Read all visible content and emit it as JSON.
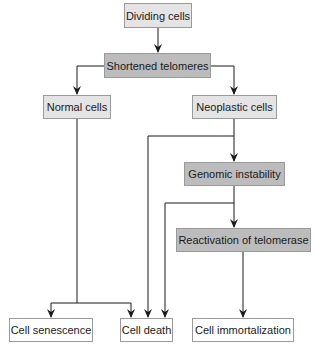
{
  "diagram": {
    "colors": {
      "light_box": "#e4e4e4",
      "dark_box": "#bcbcbc",
      "outcome_box": "#ffffff",
      "border": "#9a9a9a",
      "arrow": "#1a1a1a"
    },
    "nodes": {
      "dividing_cells": "Dividing cells",
      "shortened_telomeres": "Shortened telomeres",
      "normal_cells": "Normal cells",
      "neoplastic_cells": "Neoplastic cells",
      "genomic_instability": "Genomic instability",
      "reactivation_of_telomerase": "Reactivation of telomerase",
      "cell_senescence": "Cell senescence",
      "cell_death": "Cell death",
      "cell_immortalization": "Cell immortalization"
    },
    "edges": [
      {
        "from": "Dividing cells",
        "to": "Shortened telomeres"
      },
      {
        "from": "Shortened telomeres",
        "to": "Normal cells"
      },
      {
        "from": "Shortened telomeres",
        "to": "Neoplastic cells"
      },
      {
        "from": "Normal cells",
        "to": "Cell senescence"
      },
      {
        "from": "Normal cells",
        "to": "Cell death"
      },
      {
        "from": "Neoplastic cells",
        "to": "Genomic instability"
      },
      {
        "from": "Neoplastic cells",
        "to": "Cell death"
      },
      {
        "from": "Genomic instability",
        "to": "Reactivation of telomerase"
      },
      {
        "from": "Genomic instability",
        "to": "Cell death"
      },
      {
        "from": "Reactivation of telomerase",
        "to": "Cell immortalization"
      }
    ]
  }
}
